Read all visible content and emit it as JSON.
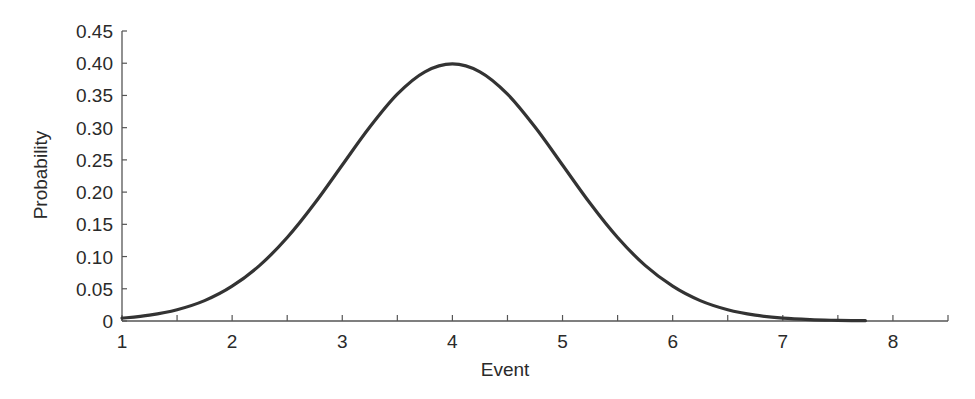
{
  "chart_data": {
    "type": "line",
    "title": "",
    "xlabel": "Event",
    "ylabel": "Probability",
    "xlim": [
      1,
      8.5
    ],
    "ylim": [
      0,
      0.45
    ],
    "grid": false,
    "legend": null,
    "x_ticks": [
      "1",
      "2",
      "3",
      "4",
      "5",
      "6",
      "7",
      "8"
    ],
    "x_minor_ticks": [
      1.5,
      2.5,
      3.5,
      4.5,
      5.5,
      6.5,
      7.5
    ],
    "y_ticks": [
      "0",
      "0.05",
      "0.10",
      "0.15",
      "0.20",
      "0.25",
      "0.30",
      "0.35",
      "0.40",
      "0.45"
    ],
    "series": [
      {
        "name": "Normal distribution (mean 4, sd 1)",
        "color": "#333333",
        "x": [
          1,
          1.25,
          1.5,
          1.75,
          2,
          2.25,
          2.5,
          2.75,
          3,
          3.25,
          3.5,
          3.75,
          4,
          4.25,
          4.5,
          4.75,
          5,
          5.25,
          5.5,
          5.75,
          6,
          6.25,
          6.5,
          6.75,
          7,
          7.25,
          7.5,
          7.75
        ],
        "y": [
          0.0044,
          0.0091,
          0.0175,
          0.0317,
          0.054,
          0.0863,
          0.1295,
          0.1826,
          0.242,
          0.3011,
          0.3521,
          0.3867,
          0.3989,
          0.3867,
          0.3521,
          0.3011,
          0.242,
          0.1826,
          0.1295,
          0.0863,
          0.054,
          0.0317,
          0.0175,
          0.0091,
          0.0044,
          0.002,
          0.0009,
          0.0004
        ]
      }
    ]
  }
}
